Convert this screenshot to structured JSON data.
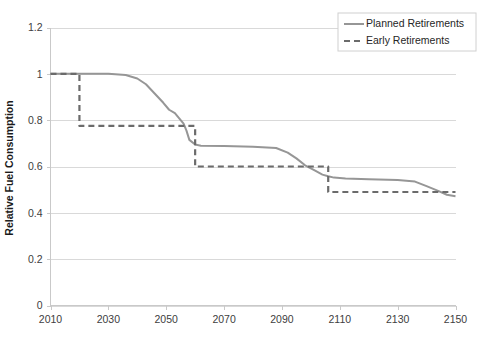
{
  "chart_data": {
    "type": "line",
    "title": "",
    "xlabel": "",
    "ylabel": "Relative Fuel Consumption",
    "xlim": [
      2010,
      2150
    ],
    "ylim": [
      0,
      1.2
    ],
    "xticks": [
      2010,
      2030,
      2050,
      2070,
      2090,
      2110,
      2130,
      2150
    ],
    "xtick_labels": [
      "2010",
      "2030",
      "2050",
      "2070",
      "2090",
      "2110",
      "2130",
      "2150"
    ],
    "yticks": [
      0,
      0.2,
      0.4,
      0.6,
      0.8,
      1,
      1.2
    ],
    "ytick_labels": [
      "0",
      "0.2",
      "0.4",
      "0.6",
      "0.8",
      "1",
      "1.2"
    ],
    "grid": true,
    "grid_axis": "y",
    "legend_position": "top-right",
    "series": [
      {
        "name": "Planned Retirements",
        "style": "solid",
        "color": "#969696",
        "x": [
          2010,
          2030,
          2036,
          2040,
          2043,
          2046,
          2049,
          2051,
          2053,
          2055,
          2056,
          2057,
          2058,
          2060,
          2062,
          2070,
          2080,
          2088,
          2092,
          2095,
          2098,
          2101,
          2104,
          2106,
          2108,
          2112,
          2120,
          2130,
          2136,
          2140,
          2144,
          2147,
          2150
        ],
        "y": [
          1.0,
          1.0,
          0.995,
          0.98,
          0.955,
          0.915,
          0.875,
          0.845,
          0.83,
          0.8,
          0.785,
          0.755,
          0.715,
          0.695,
          0.69,
          0.688,
          0.685,
          0.68,
          0.66,
          0.635,
          0.605,
          0.585,
          0.565,
          0.558,
          0.552,
          0.548,
          0.545,
          0.542,
          0.535,
          0.515,
          0.495,
          0.478,
          0.472
        ]
      },
      {
        "name": "Early Retirements",
        "style": "dashed",
        "color": "#6b6b6b",
        "x": [
          2010,
          2020,
          2020,
          2060,
          2060,
          2106,
          2106,
          2150
        ],
        "y": [
          1.0,
          1.0,
          0.775,
          0.775,
          0.6,
          0.6,
          0.49,
          0.49
        ]
      }
    ]
  },
  "legend": {
    "items": [
      {
        "label": "Planned Retirements",
        "style": "solid",
        "color": "#969696"
      },
      {
        "label": "Early Retirements",
        "style": "dashed",
        "color": "#6b6b6b"
      }
    ]
  }
}
